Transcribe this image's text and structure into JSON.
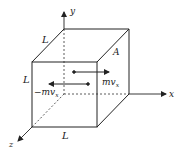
{
  "diagram": {
    "axes": {
      "x": "x",
      "y": "y",
      "z": "z"
    },
    "edge_labels": {
      "top": "L",
      "left": "L",
      "bottom": "L"
    },
    "face_label": "A",
    "momentum": {
      "positive": "mv",
      "positive_sub": "x",
      "negative": "−mv",
      "negative_sub": "x"
    },
    "colors": {
      "line": "#222222",
      "background": "#ffffff"
    }
  }
}
